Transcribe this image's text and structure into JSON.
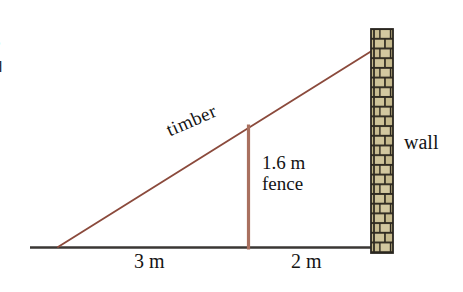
{
  "figure": {
    "type": "geometry-diagram",
    "background_color": "#ffffff",
    "labels": {
      "timber": "timber",
      "wall": "wall",
      "fence_height": "1.6 m",
      "fence": "fence",
      "dim_left": "3 m",
      "dim_right": "2 m"
    },
    "edge_text_fragment": "s\nd",
    "colors": {
      "timber_line": "#8b4a3c",
      "fence_line": "#a9705f",
      "ground_line": "#3a3734",
      "brick_face": "#cfc49a",
      "brick_mortar": "#2f2a20",
      "brick_face_dark": "#b8ab7e",
      "text": "#141414"
    },
    "measurements": {
      "ground_to_fence_m": 3,
      "fence_to_wall_m": 2,
      "fence_height_m": 1.6,
      "total_base_m": 5,
      "units": "m"
    },
    "geometry": {
      "ground_line": {
        "x1": 30,
        "y1": 247,
        "x2": 392,
        "y2": 247
      },
      "timber_line": {
        "x1": 58,
        "y1": 247,
        "x2": 378,
        "y2": 47
      },
      "fence_line": {
        "x": 248,
        "y_top": 125,
        "y_bottom": 249
      },
      "wall_rect": {
        "x": 371,
        "y": 29,
        "width": 22,
        "height": 224
      }
    },
    "brick": {
      "rows": 23,
      "row_height": 9.7,
      "pattern": "running-bond"
    }
  }
}
